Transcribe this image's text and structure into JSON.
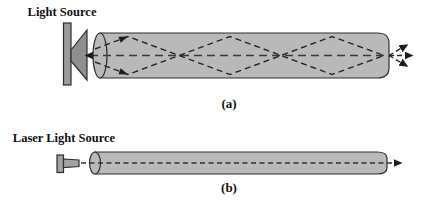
{
  "figure": {
    "panel_a": {
      "source_label": "Light Source",
      "caption": "(a)"
    },
    "panel_b": {
      "source_label": "Laser Light Source",
      "caption": "(b)"
    }
  },
  "colors": {
    "background": "#ffffff",
    "fiber_fill": "#b9b9b9",
    "source_bar_fill": "#9b9b9b",
    "source_cone_fill": "#8f8f8f",
    "laser_fill": "#a3a3a3"
  }
}
